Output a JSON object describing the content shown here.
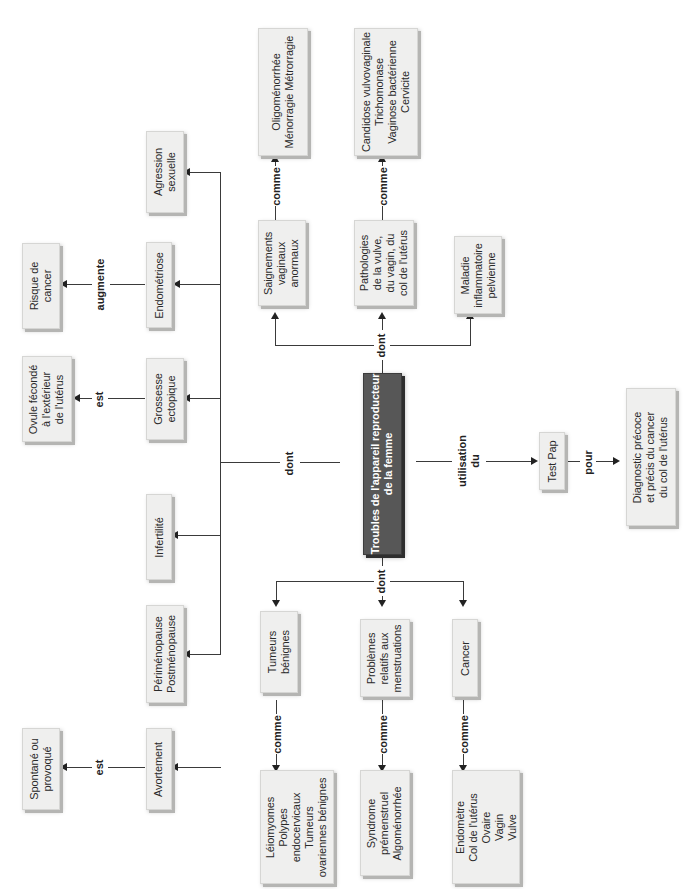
{
  "diagram": {
    "central_concept": "Troubles de l'appareil reproducteur\nde la femme",
    "link_labels": {
      "dont_left": "dont",
      "dont_top": "dont",
      "dont_bottom": "dont",
      "utilisation": "utilisation\ndu",
      "pour": "pour",
      "est_grossesse": "est",
      "augmente": "augmente",
      "est_avortement": "est",
      "comme_saignements": "comme",
      "comme_pathologies": "comme",
      "comme_tumeurs": "comme",
      "comme_problemes": "comme",
      "comme_cancer": "comme"
    },
    "left_branch": [
      {
        "id": "agression",
        "label": "Agression\nsexuelle"
      },
      {
        "id": "endometriose",
        "label": "Endométriose",
        "relation": "augmente",
        "target": "Risque de\ncancer"
      },
      {
        "id": "grossesse",
        "label": "Grossesse\nectopique",
        "relation": "est",
        "target": "Ovule fécondé\nà l'extérieur\nde l'utérus"
      },
      {
        "id": "infertilite",
        "label": "Infertilité"
      },
      {
        "id": "menopause",
        "label": "Périménopause\nPostménopause"
      },
      {
        "id": "avortement",
        "label": "Avortement",
        "relation": "est",
        "target": "Spontané ou\nprovoqué"
      }
    ],
    "top_branch": [
      {
        "id": "saignements",
        "label": "Saignements\nvaginaux\nanormaux",
        "relation": "comme",
        "target": "Oligoménorrhée\nMénorragie Métrorragie"
      },
      {
        "id": "pathologies",
        "label": "Pathologies\nde la vulve,\ndu vagin, du\ncol de l'utérus",
        "relation": "comme",
        "target": "Candidose vulvovaginale\nTrichomonase\nVaginose bactérienne\nCervicite"
      },
      {
        "id": "mip",
        "label": "Maladie\ninflammatoire\npelvienne"
      }
    ],
    "bottom_branch": [
      {
        "id": "tumeurs",
        "label": "Tumeurs\nbénignes",
        "relation": "comme",
        "target": "Léiomyomes\nPolypes\nendocervicaux\nTumeurs\novariennes bénignes"
      },
      {
        "id": "problemes",
        "label": "Problèmes\nrelatifs aux\nmenstruations",
        "relation": "comme",
        "target": "Syndrome\nprémenstruel\nAlgoménorrhée"
      },
      {
        "id": "cancer",
        "label": "Cancer",
        "relation": "comme",
        "target": "Endomètre\nCol de l'utérus\nOvaire\nVagin\nVulve"
      }
    ],
    "right_branch": {
      "test": "Test Pap",
      "purpose": "Diagnostic précoce\net précis du cancer\ndu col de l'utérus"
    }
  }
}
